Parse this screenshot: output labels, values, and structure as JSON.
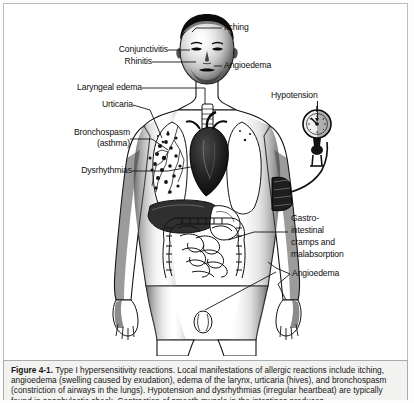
{
  "figure": {
    "number": "Figure 4-1.",
    "caption_line1": "Type I hypersensitivity reactions. Local manifestations of allergic reactions include itching,",
    "caption_line2": "angioedema (swelling caused by exudation), edema of the larynx, urticaria (hives), and bronchospasm",
    "caption_line3": "(constriction of airways in the lungs). Hypotension and dysrhythmias (irregular heartbeat) are typically found in",
    "caption_line4": "anaphylactic shock. Contraction of smooth muscle in the intestines produces"
  },
  "labels": {
    "itching": "Itching",
    "conjunctivitis": "Conjunctivitis",
    "rhinitis": "Rhinitis",
    "angioedema_face": "Angioedema",
    "laryngeal_edema": "Laryngeal edema",
    "urticaria": "Urticaria",
    "hypotension": "Hypotension",
    "bronchospasm_l1": "Bronchospasm",
    "bronchospasm_l2": "(asthma)",
    "dysrhythmias": "Dysrhythmias",
    "gi_l1": "Gastro-",
    "gi_l2": "intestinal",
    "gi_l3": "cramps and",
    "gi_l4": "malabsorption",
    "angioedema_hand": "Angioedema"
  },
  "illustration": {
    "alt": "Black and white anatomical drawing of a standing male figure with internal organs visible: lungs, heart, liver, stomach and intestines, with a blood pressure cuff on the left arm connected to a sphygmomanometer gauge.",
    "ink_color": "#111111",
    "paper_color": "#ffffff"
  }
}
